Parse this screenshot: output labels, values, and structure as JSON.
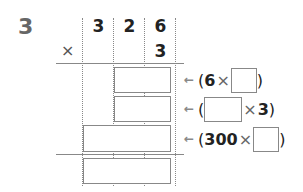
{
  "problem": {
    "number": "3",
    "multiplicand_digits": [
      "3",
      "2",
      "6"
    ],
    "multiplier": "3",
    "operator": "×"
  },
  "partial_products": [
    {
      "arrow": "←",
      "open": "(",
      "left": "6",
      "times": "×",
      "right": "",
      "close": ")"
    },
    {
      "arrow": "←",
      "open": "(",
      "left": "",
      "times": "×",
      "right": "3",
      "close": ")"
    },
    {
      "arrow": "←",
      "open": "(",
      "left": "300",
      "times": "×",
      "right": "",
      "close": ")"
    }
  ]
}
